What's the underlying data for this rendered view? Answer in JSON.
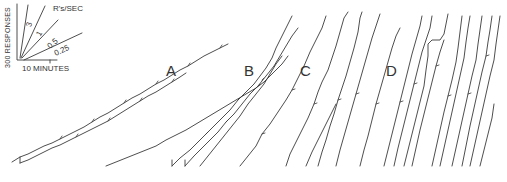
{
  "figure": {
    "type": "cumulative-response-records",
    "panels": [
      {
        "label": "A",
        "x": 190,
        "y": 68
      },
      {
        "label": "B",
        "x": 255,
        "y": 68
      },
      {
        "label": "C",
        "x": 302,
        "y": 68
      },
      {
        "label": "D",
        "x": 384,
        "y": 68
      }
    ],
    "legend": {
      "y_axis_label": "300 RESPONSES",
      "x_axis_label": "10 MINUTES",
      "rate_header": "R's/SEC",
      "rates": [
        "3",
        "1",
        "0.5",
        "0.25"
      ]
    },
    "annotations": {
      "record_marks": [
        "a",
        "b",
        "c",
        "d"
      ]
    },
    "colors": {
      "ink": "#333333",
      "background": "#ffffff"
    }
  }
}
